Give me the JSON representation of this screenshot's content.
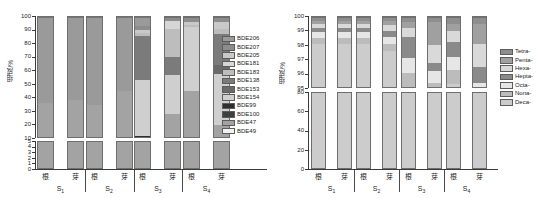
{
  "figure": {
    "background": "#ffffff",
    "panels": [
      "left-pbde-congener-chart",
      "right-homologue-chart"
    ]
  },
  "left": {
    "ylabel": "组成/%",
    "y_upper_ticks": [
      "100",
      "90",
      "80",
      "70",
      "60",
      "50",
      "40",
      "30",
      "20",
      "10"
    ],
    "y_lower_ticks": [
      "5",
      "4",
      "3",
      "2",
      "1",
      "0"
    ],
    "x_tick_labels": [
      "根",
      "芽",
      "根",
      "芽",
      "根",
      "芽",
      "根",
      "芽"
    ],
    "group_labels": [
      "S",
      "S",
      "S",
      "S"
    ],
    "group_subs": [
      "1",
      "2",
      "3",
      "4"
    ],
    "legend": [
      {
        "label": "BDE206",
        "color": "#9a9a9a"
      },
      {
        "label": "BDE207",
        "color": "#8d8d8d"
      },
      {
        "label": "BDE205",
        "color": "#c9c9c9"
      },
      {
        "label": "BDE181",
        "color": "#d6d6d6"
      },
      {
        "label": "BDE183",
        "color": "#bdbdbd"
      },
      {
        "label": "BDE138",
        "color": "#7b7b7b"
      },
      {
        "label": "BDE153",
        "color": "#6a6a6a"
      },
      {
        "label": "BDE154",
        "color": "#cfcfcf"
      },
      {
        "label": "BDE99",
        "color": "#2e2e2e"
      },
      {
        "label": "BDE100",
        "color": "#3f3f3f"
      },
      {
        "label": "BDE47",
        "color": "#a3a3a3"
      },
      {
        "label": "BDE49",
        "color": "#f2f2f2"
      }
    ]
  },
  "right": {
    "ylabel": "组成/%",
    "y_upper_ticks": [
      "100",
      "99",
      "98",
      "97",
      "96",
      "95"
    ],
    "y_lower_ticks": [
      "80",
      "60",
      "40",
      "20",
      "0"
    ],
    "x_tick_labels": [
      "根",
      "芽",
      "根",
      "芽",
      "根",
      "芽",
      "根",
      "芽"
    ],
    "group_labels": [
      "S",
      "S",
      "S",
      "S"
    ],
    "group_subs": [
      "1",
      "2",
      "3",
      "4"
    ],
    "legend": [
      {
        "label": "Tetra-",
        "color": "#8e8e8e"
      },
      {
        "label": "Penta-",
        "color": "#a0a0a0"
      },
      {
        "label": "Hexa-",
        "color": "#d9d9d9"
      },
      {
        "label": "Hepta-",
        "color": "#8a8a8a"
      },
      {
        "label": "Octa-",
        "color": "#e6e6e6"
      },
      {
        "label": "Nona-",
        "color": "#bcbcbc"
      },
      {
        "label": "Deca-",
        "color": "#cccccc"
      }
    ]
  },
  "chart_data": [
    {
      "type": "bar",
      "id": "left-pbde-congener-chart",
      "title": "",
      "xlabel": "",
      "ylabel": "组成/%",
      "stacked": true,
      "broken_axis": true,
      "axis_upper_range": [
        10,
        100
      ],
      "axis_lower_range": [
        0,
        5
      ],
      "categories": [
        "S1-根",
        "S1-芽",
        "S2-根",
        "S2-芽",
        "S3-根",
        "S3-芽",
        "S4-根",
        "S4-芽"
      ],
      "groups": [
        "S1",
        "S2",
        "S3",
        "S4"
      ],
      "series": [
        {
          "name": "BDE206",
          "color": "#9a9a9a",
          "values": [
            62.5,
            60.6,
            64.0,
            54.2,
            6.0,
            0.0,
            0.0,
            0.0
          ]
        },
        {
          "name": "BDE207",
          "color": "#8d8d8d",
          "values": [
            0.0,
            0.0,
            0.0,
            0.0,
            3.0,
            2.0,
            3.0,
            3.0
          ]
        },
        {
          "name": "BDE205",
          "color": "#c9c9c9",
          "values": [
            0.0,
            0.0,
            0.0,
            0.0,
            2.0,
            0.0,
            2.0,
            5.0
          ]
        },
        {
          "name": "BDE181",
          "color": "#d6d6d6",
          "values": [
            0.0,
            0.0,
            0.0,
            0.0,
            0.0,
            6.0,
            0.0,
            0.0
          ]
        },
        {
          "name": "BDE183",
          "color": "#bdbdbd",
          "values": [
            0.0,
            0.0,
            0.0,
            0.0,
            2.0,
            21.0,
            2.0,
            4.0
          ]
        },
        {
          "name": "BDE138",
          "color": "#7b7b7b",
          "values": [
            0.0,
            0.0,
            0.0,
            0.0,
            33.0,
            13.0,
            0.0,
            23.0
          ]
        },
        {
          "name": "BDE153",
          "color": "#6a6a6a",
          "values": [
            0.0,
            0.0,
            0.0,
            0.0,
            0.0,
            0.0,
            0.0,
            6.0
          ]
        },
        {
          "name": "BDE154",
          "color": "#cfcfcf",
          "values": [
            0.0,
            0.0,
            0.0,
            0.0,
            41.0,
            29.0,
            47.0,
            38.0
          ]
        },
        {
          "name": "BDE99",
          "color": "#2e2e2e",
          "values": [
            0.0,
            0.0,
            0.0,
            0.0,
            3.0,
            0.0,
            0.0,
            0.0
          ]
        },
        {
          "name": "BDE100",
          "color": "#3f3f3f",
          "values": [
            0.0,
            0.0,
            0.0,
            0.0,
            1.0,
            0.0,
            0.0,
            0.0
          ]
        },
        {
          "name": "BDE47",
          "color": "#a3a3a3",
          "values": [
            37.5,
            39.4,
            36.0,
            45.8,
            9.0,
            29.0,
            46.0,
            21.0
          ]
        },
        {
          "name": "BDE49",
          "color": "#f2f2f2",
          "values": [
            0.0,
            0.0,
            0.0,
            0.0,
            0.0,
            0.0,
            0.0,
            0.0
          ]
        }
      ],
      "legend_position": "right"
    },
    {
      "type": "bar",
      "id": "right-homologue-chart",
      "title": "",
      "xlabel": "",
      "ylabel": "组成/%",
      "stacked": true,
      "broken_axis": true,
      "axis_upper_range": [
        95,
        100
      ],
      "axis_lower_range": [
        0,
        80
      ],
      "categories": [
        "S1-根",
        "S1-芽",
        "S2-根",
        "S2-芽",
        "S3-根",
        "S3-芽",
        "S4-根",
        "S4-芽"
      ],
      "groups": [
        "S1",
        "S2",
        "S3",
        "S4"
      ],
      "series": [
        {
          "name": "Tetra-",
          "color": "#8e8e8e",
          "values": [
            0.2,
            0.2,
            0.2,
            0.2,
            0.3,
            0.3,
            0.4,
            0.4
          ]
        },
        {
          "name": "Penta-",
          "color": "#a0a0a0",
          "values": [
            0.2,
            0.2,
            0.2,
            0.3,
            0.4,
            1.6,
            0.5,
            1.4
          ]
        },
        {
          "name": "Hexa-",
          "color": "#d9d9d9",
          "values": [
            0.3,
            0.3,
            0.3,
            0.4,
            0.6,
            1.2,
            0.8,
            1.6
          ]
        },
        {
          "name": "Hepta-",
          "color": "#8a8a8a",
          "values": [
            0.3,
            0.3,
            0.3,
            0.4,
            1.5,
            0.6,
            1.0,
            1.1
          ]
        },
        {
          "name": "Octa-",
          "color": "#e6e6e6",
          "values": [
            0.4,
            0.4,
            0.4,
            0.5,
            1.0,
            0.8,
            0.9,
            0.9
          ]
        },
        {
          "name": "Nona-",
          "color": "#bcbcbc",
          "values": [
            0.4,
            0.4,
            0.4,
            0.5,
            1.0,
            1.0,
            1.0,
            1.0
          ]
        },
        {
          "name": "Deca-",
          "color": "#cccccc",
          "values": [
            98.2,
            98.2,
            98.2,
            97.7,
            95.2,
            94.5,
            95.4,
            93.6
          ]
        }
      ],
      "legend_position": "right"
    }
  ]
}
